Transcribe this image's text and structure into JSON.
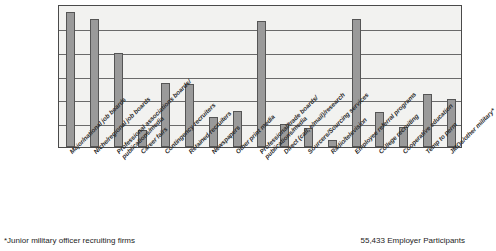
{
  "chart_data": {
    "type": "bar",
    "title": "",
    "subtitle": "",
    "xlabel": "",
    "ylabel": "",
    "grid": true,
    "legend": false,
    "ylim": [
      0,
      6
    ],
    "gridline_count": 6,
    "orientation": "vertical",
    "bar_color": "#9a9a9a",
    "bar_border_color": "#555555",
    "plot_background": "#f2f2f0",
    "categories": [
      "Major/national job boards",
      "Niche/regional job boards",
      "Professional associations boards/\npublications/media",
      "Career fairs",
      "Contingency recruiters",
      "Retained recruiters",
      "Newspapers",
      "Other print media",
      "Professional/trade boards/\npublications/media",
      "Direct (call, e/mail)/research",
      "Sourcers/Sourcing services",
      "Radio/television",
      "Employee referral programs",
      "College recruiting",
      "Cooperative education",
      "Temp to perm",
      "JMOs/other military*"
    ],
    "values": [
      5.67,
      5.37,
      3.95,
      0.71,
      2.69,
      2.64,
      1.26,
      1.51,
      5.29,
      0.97,
      0.8,
      0.29,
      5.37,
      1.47,
      0.84,
      2.22,
      2.02
    ]
  },
  "footnote": "*Junior military officer recruiting firms",
  "participants": "55,433 Employer Participants"
}
